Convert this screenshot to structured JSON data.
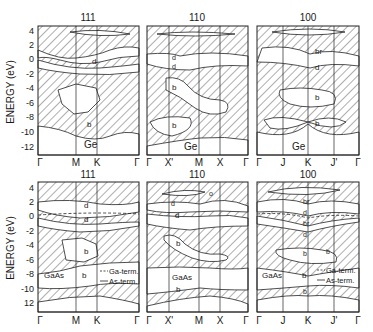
{
  "figure": {
    "ylabel": "ENERGY (eV)",
    "yticks_top": [
      "4",
      "2",
      "0",
      "-2",
      "-4",
      "-6",
      "-8",
      "-10",
      "-12"
    ],
    "yticks_bottom": [
      "4",
      "2",
      "0",
      "-2",
      "-4",
      "-6",
      "-8",
      "-10",
      "12"
    ],
    "legend": {
      "ga_term": "Ga-term.",
      "as_term": "As-term."
    }
  },
  "panels": [
    {
      "id": "ge-111",
      "title": "111",
      "material": "Ge",
      "kpoints": [
        "Γ",
        "M",
        "K",
        "Γ"
      ],
      "labels": [
        {
          "t": "d"
        },
        {
          "t": "b"
        }
      ]
    },
    {
      "id": "ge-110",
      "title": "110",
      "material": "Ge",
      "kpoints": [
        "Γ",
        "X'",
        "M",
        "X",
        "Γ"
      ],
      "labels": [
        {
          "t": "d"
        },
        {
          "t": "d"
        },
        {
          "t": "b"
        },
        {
          "t": "b"
        }
      ]
    },
    {
      "id": "ge-100",
      "title": "100",
      "material": "Ge",
      "kpoints": [
        "Γ",
        "J",
        "K",
        "J'",
        "Γ"
      ],
      "labels": [
        {
          "t": "br"
        },
        {
          "t": "d"
        },
        {
          "t": "b"
        },
        {
          "t": "b"
        }
      ]
    },
    {
      "id": "gaas-111",
      "title": "111",
      "material": "GaAs",
      "kpoints": [
        "Γ",
        "M",
        "K",
        "Γ"
      ],
      "labels": [
        {
          "t": "d"
        },
        {
          "t": "d"
        },
        {
          "t": "b"
        },
        {
          "t": "b"
        }
      ]
    },
    {
      "id": "gaas-110",
      "title": "110",
      "material": "GaAs",
      "kpoints": [
        "Γ",
        "X'",
        "M",
        "X",
        "Γ"
      ],
      "labels": [
        {
          "t": "d"
        },
        {
          "t": "d"
        },
        {
          "t": "b"
        },
        {
          "t": "b"
        },
        {
          "t": "o"
        }
      ]
    },
    {
      "id": "gaas-100",
      "title": "100",
      "material": "GaAs",
      "kpoints": [
        "Γ",
        "J",
        "K",
        "J'",
        "Γ"
      ],
      "labels": [
        {
          "t": "br"
        },
        {
          "t": "d"
        },
        {
          "t": "br"
        },
        {
          "t": "d"
        },
        {
          "t": "b"
        },
        {
          "t": "b"
        },
        {
          "t": "b"
        },
        {
          "t": "b"
        }
      ]
    }
  ]
}
